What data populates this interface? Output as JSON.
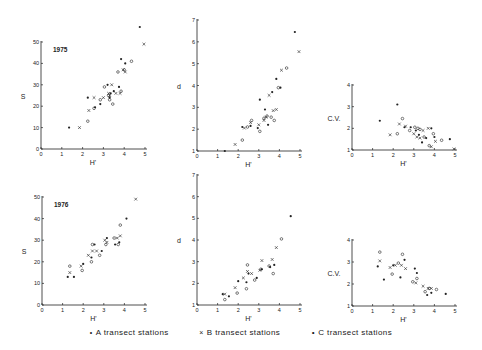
{
  "legend": {
    "items": [
      {
        "marker": "•",
        "label": "A transect stations",
        "symbol": "dot"
      },
      {
        "marker": "×",
        "label": "B transect stations",
        "symbol": "cross"
      },
      {
        "marker": "∘",
        "label": "C transect stations",
        "symbol": "circle"
      }
    ]
  },
  "chart_data": [
    {
      "type": "scatter",
      "title": "1975",
      "xlabel": "H'",
      "ylabel": "S",
      "xlim": [
        0,
        5
      ],
      "ylim": [
        0,
        50
      ],
      "xticks": [
        0,
        1,
        2,
        3,
        4,
        5
      ],
      "yticks": [
        0,
        10,
        20,
        30,
        40,
        50
      ],
      "box": {
        "x0": 41,
        "x1": 145,
        "y0": 149,
        "y1": 42
      },
      "points": [
        [
          1.35,
          10
        ],
        [
          1.85,
          10
        ],
        [
          2.25,
          13
        ],
        [
          2.25,
          24
        ],
        [
          2.3,
          18
        ],
        [
          2.55,
          19
        ],
        [
          2.6,
          19.5
        ],
        [
          2.55,
          24
        ],
        [
          2.85,
          23
        ],
        [
          2.85,
          21
        ],
        [
          3.0,
          24
        ],
        [
          3.05,
          29
        ],
        [
          3.2,
          30
        ],
        [
          3.25,
          26
        ],
        [
          3.25,
          25
        ],
        [
          3.3,
          24
        ],
        [
          3.3,
          25
        ],
        [
          3.3,
          23
        ],
        [
          3.35,
          26
        ],
        [
          3.4,
          30
        ],
        [
          3.45,
          21
        ],
        [
          3.5,
          27
        ],
        [
          3.6,
          26
        ],
        [
          3.7,
          36
        ],
        [
          3.75,
          29
        ],
        [
          3.8,
          26
        ],
        [
          3.85,
          27
        ],
        [
          3.85,
          42
        ],
        [
          3.95,
          37
        ],
        [
          4.0,
          37
        ],
        [
          4.05,
          40
        ],
        [
          4.05,
          36
        ],
        [
          4.35,
          41
        ],
        [
          4.75,
          57
        ],
        [
          4.95,
          49
        ]
      ]
    },
    {
      "type": "scatter",
      "title": "",
      "xlabel": "H'",
      "ylabel": "d",
      "xlim": [
        0,
        5
      ],
      "ylim": [
        1,
        7
      ],
      "xticks": [
        0,
        1,
        2,
        3,
        4,
        5
      ],
      "yticks": [
        1,
        2,
        3,
        4,
        5,
        6,
        7
      ],
      "box": {
        "x0": 197,
        "x1": 300,
        "y0": 151,
        "y1": 20
      },
      "points": [
        [
          1.35,
          1.0
        ],
        [
          1.85,
          1.3
        ],
        [
          2.2,
          1.5
        ],
        [
          2.2,
          2.1
        ],
        [
          2.3,
          2.05
        ],
        [
          2.45,
          2.1
        ],
        [
          2.6,
          2.15
        ],
        [
          2.6,
          2.3
        ],
        [
          2.65,
          2.4
        ],
        [
          2.95,
          2.05
        ],
        [
          3.0,
          2.2
        ],
        [
          3.05,
          1.9
        ],
        [
          3.05,
          3.35
        ],
        [
          3.25,
          2.4
        ],
        [
          3.25,
          2.5
        ],
        [
          3.3,
          2.9
        ],
        [
          3.35,
          2.55
        ],
        [
          3.4,
          2.6
        ],
        [
          3.45,
          2.2
        ],
        [
          3.5,
          3.55
        ],
        [
          3.6,
          2.55
        ],
        [
          3.65,
          3.7
        ],
        [
          3.7,
          2.85
        ],
        [
          3.75,
          2.4
        ],
        [
          3.85,
          4.3
        ],
        [
          3.85,
          2.9
        ],
        [
          3.95,
          3.9
        ],
        [
          4.05,
          3.9
        ],
        [
          4.1,
          4.7
        ],
        [
          4.35,
          4.8
        ],
        [
          4.75,
          6.45
        ],
        [
          4.95,
          5.55
        ]
      ]
    },
    {
      "type": "scatter",
      "title": "",
      "xlabel": "H'",
      "ylabel": "C.V.",
      "xlim": [
        0,
        5
      ],
      "ylim": [
        1,
        4
      ],
      "xticks": [
        0,
        1,
        2,
        3,
        4,
        5
      ],
      "yticks": [
        1,
        2,
        3,
        4
      ],
      "box": {
        "x0": 352,
        "x1": 455,
        "y0": 150,
        "y1": 85
      },
      "points": [
        [
          1.35,
          2.35
        ],
        [
          1.85,
          1.7
        ],
        [
          2.2,
          1.75
        ],
        [
          2.2,
          3.1
        ],
        [
          2.3,
          2.2
        ],
        [
          2.45,
          2.45
        ],
        [
          2.55,
          2.05
        ],
        [
          2.6,
          2.1
        ],
        [
          2.8,
          1.9
        ],
        [
          2.85,
          2.05
        ],
        [
          3.0,
          1.75
        ],
        [
          3.05,
          2.05
        ],
        [
          3.1,
          1.9
        ],
        [
          3.15,
          1.6
        ],
        [
          3.2,
          2.0
        ],
        [
          3.25,
          1.7
        ],
        [
          3.3,
          1.55
        ],
        [
          3.3,
          1.95
        ],
        [
          3.4,
          1.35
        ],
        [
          3.45,
          1.9
        ],
        [
          3.5,
          1.6
        ],
        [
          3.6,
          1.55
        ],
        [
          3.7,
          2.0
        ],
        [
          3.75,
          1.2
        ],
        [
          3.85,
          2.0
        ],
        [
          3.85,
          1.15
        ],
        [
          3.95,
          1.75
        ],
        [
          4.0,
          1.6
        ],
        [
          4.05,
          1.4
        ],
        [
          4.35,
          1.45
        ],
        [
          4.75,
          1.5
        ],
        [
          4.95,
          1.05
        ]
      ]
    },
    {
      "type": "scatter",
      "title": "1976",
      "xlabel": "H'",
      "ylabel": "S",
      "xlim": [
        0,
        5
      ],
      "ylim": [
        0,
        50
      ],
      "xticks": [
        0,
        1,
        2,
        3,
        4,
        5
      ],
      "yticks": [
        0,
        10,
        20,
        30,
        40,
        50
      ],
      "box": {
        "x0": 42,
        "x1": 145,
        "y0": 305,
        "y1": 197
      },
      "points": [
        [
          1.25,
          13
        ],
        [
          1.35,
          15
        ],
        [
          1.35,
          18
        ],
        [
          1.55,
          13
        ],
        [
          1.9,
          18
        ],
        [
          1.95,
          16
        ],
        [
          2.0,
          19
        ],
        [
          2.25,
          23
        ],
        [
          2.4,
          20
        ],
        [
          2.4,
          22
        ],
        [
          2.45,
          25
        ],
        [
          2.45,
          28
        ],
        [
          2.55,
          28
        ],
        [
          2.65,
          25
        ],
        [
          2.8,
          23
        ],
        [
          2.9,
          25
        ],
        [
          3.05,
          30
        ],
        [
          3.1,
          28
        ],
        [
          3.15,
          31
        ],
        [
          3.15,
          29
        ],
        [
          3.5,
          31
        ],
        [
          3.55,
          28
        ],
        [
          3.65,
          31
        ],
        [
          3.7,
          28
        ],
        [
          3.75,
          29
        ],
        [
          3.8,
          32
        ],
        [
          3.8,
          37
        ],
        [
          4.1,
          40
        ],
        [
          4.55,
          49
        ]
      ]
    },
    {
      "type": "scatter",
      "title": "",
      "xlabel": "H'",
      "ylabel": "d",
      "xlim": [
        0,
        5
      ],
      "ylim": [
        1,
        7
      ],
      "xticks": [
        0,
        1,
        2,
        3,
        4,
        5
      ],
      "yticks": [
        1,
        2,
        3,
        4,
        5,
        6,
        7
      ],
      "box": {
        "x0": 197,
        "x1": 300,
        "y0": 305,
        "y1": 175
      },
      "points": [
        [
          1.25,
          1.5
        ],
        [
          1.35,
          1.5
        ],
        [
          1.35,
          1.25
        ],
        [
          1.55,
          1.4
        ],
        [
          1.85,
          1.8
        ],
        [
          1.95,
          1.55
        ],
        [
          2.0,
          2.1
        ],
        [
          2.25,
          2.25
        ],
        [
          2.4,
          1.75
        ],
        [
          2.4,
          2.05
        ],
        [
          2.45,
          2.55
        ],
        [
          2.45,
          2.85
        ],
        [
          2.5,
          2.45
        ],
        [
          2.65,
          2.45
        ],
        [
          2.8,
          2.15
        ],
        [
          2.9,
          2.25
        ],
        [
          3.05,
          2.6
        ],
        [
          3.1,
          2.65
        ],
        [
          3.15,
          2.65
        ],
        [
          3.15,
          3.05
        ],
        [
          3.5,
          2.8
        ],
        [
          3.55,
          2.75
        ],
        [
          3.65,
          3.1
        ],
        [
          3.7,
          2.45
        ],
        [
          3.75,
          2.85
        ],
        [
          3.85,
          3.65
        ],
        [
          4.1,
          4.05
        ],
        [
          4.55,
          5.1
        ]
      ]
    },
    {
      "type": "scatter",
      "title": "",
      "xlabel": "H'",
      "ylabel": "C.V.",
      "xlim": [
        0,
        5
      ],
      "ylim": [
        1,
        4
      ],
      "xticks": [
        0,
        1,
        2,
        3,
        4,
        5
      ],
      "yticks": [
        1,
        2,
        3,
        4
      ],
      "box": {
        "x0": 352,
        "x1": 455,
        "y0": 306,
        "y1": 240
      },
      "points": [
        [
          1.25,
          2.8
        ],
        [
          1.35,
          3.05
        ],
        [
          1.35,
          3.45
        ],
        [
          1.55,
          2.2
        ],
        [
          1.85,
          2.75
        ],
        [
          1.95,
          2.45
        ],
        [
          2.0,
          2.85
        ],
        [
          2.1,
          2.85
        ],
        [
          2.25,
          2.95
        ],
        [
          2.35,
          2.3
        ],
        [
          2.4,
          2.85
        ],
        [
          2.45,
          3.35
        ],
        [
          2.55,
          3.1
        ],
        [
          2.6,
          2.7
        ],
        [
          2.95,
          2.1
        ],
        [
          3.05,
          2.7
        ],
        [
          3.1,
          2.05
        ],
        [
          3.15,
          2.25
        ],
        [
          3.15,
          2.5
        ],
        [
          3.45,
          1.9
        ],
        [
          3.55,
          1.65
        ],
        [
          3.65,
          1.5
        ],
        [
          3.7,
          1.8
        ],
        [
          3.75,
          1.8
        ],
        [
          3.85,
          1.6
        ],
        [
          3.85,
          1.8
        ],
        [
          4.1,
          1.75
        ],
        [
          4.55,
          1.55
        ]
      ]
    }
  ]
}
